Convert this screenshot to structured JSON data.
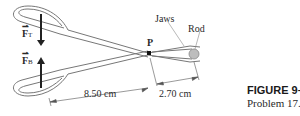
{
  "figure": {
    "title": "FIGURE 9–51",
    "caption": "Problem 17."
  },
  "labels": {
    "force_top": "F",
    "force_top_sub": "T",
    "force_bottom": "F",
    "force_bottom_sub": "B",
    "pivot": "P",
    "jaws": "Jaws",
    "rod": "Rod"
  },
  "dimensions": {
    "handle_length": "8.50 cm",
    "jaw_length": "2.70 cm"
  },
  "colors": {
    "line": "#555555",
    "arrow": "#222222",
    "rod_fill": "#bdbdbd"
  }
}
